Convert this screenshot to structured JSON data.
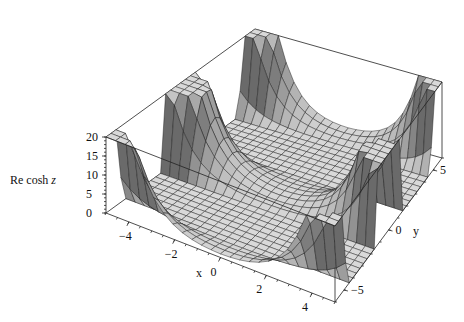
{
  "chart_data": {
    "type": "surface3d",
    "title": "",
    "function": "Re cosh z, z = x + i y",
    "xlabel": "x",
    "ylabel": "y",
    "zlabel": "Re cosh z",
    "xlim": [
      -5,
      5
    ],
    "ylim": [
      -6,
      6
    ],
    "zlim": [
      0,
      20
    ],
    "clip_max": 20,
    "x_ticks": [
      "-4",
      "-2",
      "0",
      "2",
      "4"
    ],
    "y_ticks": [
      "-5",
      "0",
      "5"
    ],
    "z_ticks": [
      "0",
      "5",
      "10",
      "15",
      "20"
    ],
    "grid_x": 24,
    "grid_y": 30,
    "box": true
  },
  "labels": {
    "zaxis_prefix": "Re cosh ",
    "zaxis_var": "z",
    "xaxis": "x",
    "yaxis": "y"
  },
  "colors": {
    "surface_light": "#d9d9d9",
    "surface_dark": "#6a6a6a",
    "mesh": "#1a1a1a",
    "box": "#222222"
  }
}
